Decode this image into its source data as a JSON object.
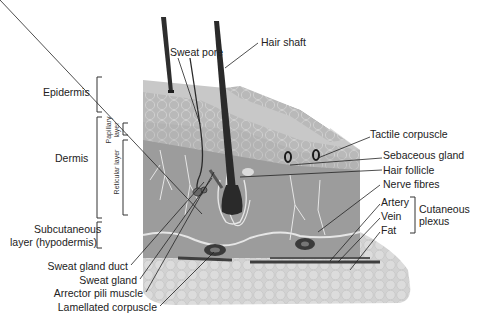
{
  "diagram": {
    "layers": {
      "epidermis": "Epidermis",
      "dermis": "Dermis",
      "papillary": "Papillary layer",
      "papillary_l1": "Papillary",
      "papillary_l2": "layer",
      "reticular": "Reticular layer",
      "subcutaneous_l1": "Subcutaneous",
      "subcutaneous_l2": "layer (hypodermis)"
    },
    "labels_top": {
      "sweat_pore": "Sweat pore",
      "hair_shaft": "Hair shaft"
    },
    "labels_right": {
      "tactile_corpuscle": "Tactile corpuscle",
      "sebaceous_gland": "Sebaceous gland",
      "hair_follicle": "Hair follicle",
      "nerve_fibres": "Nerve fibres",
      "artery": "Artery",
      "vein": "Vein",
      "fat": "Fat",
      "plexus_l1": "Cutaneous",
      "plexus_l2": "plexus"
    },
    "labels_bottom_left": {
      "sweat_gland_duct": "Sweat gland duct",
      "sweat_gland": "Sweat gland",
      "arrector_pili": "Arrector pili muscle",
      "lamellated_corpuscle": "Lamellated corpuscle"
    },
    "colors": {
      "background": "#ffffff",
      "epidermis_top": "#c9c9c9",
      "epidermis_cells": "#b5b5b5",
      "dermis": "#9a9a9a",
      "dermis_light": "#a8a8a8",
      "fat": "#d4d4d4",
      "hair": "#2e2e2e",
      "nerve": "#e8e8e8",
      "leader_line": "#222222"
    }
  }
}
